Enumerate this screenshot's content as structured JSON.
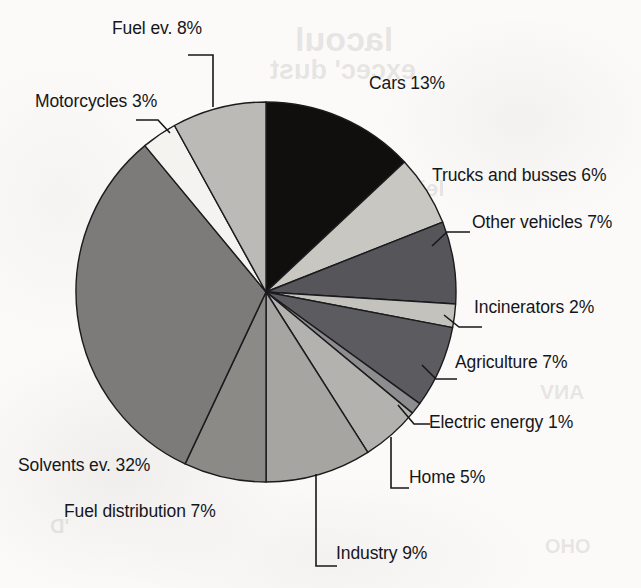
{
  "chart_data": {
    "type": "pie",
    "title": "",
    "subtitle": "",
    "xlabel": "",
    "ylabel": "",
    "legend_position": "callout-labels",
    "grid": false,
    "units": "percent",
    "start_angle_deg": 0,
    "direction": "clockwise",
    "categories": [
      "Cars",
      "Trucks and busses",
      "Other vehicles",
      "Incinerators",
      "Agriculture",
      "Electric energy",
      "Home",
      "Industry",
      "Fuel distribution",
      "Solvents ev.",
      "Motorcycles",
      "Fuel ev."
    ],
    "values": [
      13,
      6,
      7,
      2,
      7,
      1,
      5,
      9,
      7,
      32,
      3,
      8
    ],
    "slice_colors": [
      "#100f0e",
      "#c9c7c2",
      "#56555a",
      "#c4c2bd",
      "#5c5b60",
      "#8d8c8f",
      "#b4b2ae",
      "#a7a5a1",
      "#8c8a87",
      "#7d7b79",
      "#f4f3f0",
      "#bcbab6"
    ],
    "slices": [
      {
        "label": "Cars 13%",
        "name": "Cars",
        "value": 13,
        "color": "#100f0e"
      },
      {
        "label": "Trucks and busses 6%",
        "name": "Trucks and busses",
        "value": 6,
        "color": "#c9c7c2"
      },
      {
        "label": "Other vehicles 7%",
        "name": "Other vehicles",
        "value": 7,
        "color": "#56555a"
      },
      {
        "label": "Incinerators 2%",
        "name": "Incinerators",
        "value": 2,
        "color": "#c4c2bd"
      },
      {
        "label": "Agriculture 7%",
        "name": "Agriculture",
        "value": 7,
        "color": "#5c5b60"
      },
      {
        "label": "Electric energy 1%",
        "name": "Electric energy",
        "value": 1,
        "color": "#8d8c8f"
      },
      {
        "label": "Home 5%",
        "name": "Home",
        "value": 5,
        "color": "#b4b2ae"
      },
      {
        "label": "Industry 9%",
        "name": "Industry",
        "value": 9,
        "color": "#a7a5a1"
      },
      {
        "label": "Fuel distribution 7%",
        "name": "Fuel distribution",
        "value": 7,
        "color": "#8c8a87"
      },
      {
        "label": "Solvents ev. 32%",
        "name": "Solvents ev.",
        "value": 32,
        "color": "#7d7b79"
      },
      {
        "label": "Motorcycles 3%",
        "name": "Motorcycles",
        "value": 3,
        "color": "#f4f3f0"
      },
      {
        "label": "Fuel ev. 8%",
        "name": "Fuel ev.",
        "value": 8,
        "color": "#bcbab6"
      }
    ]
  },
  "labels": {
    "cars": "Cars 13%",
    "trucks_and_busses": "Trucks and busses 6%",
    "other_vehicles": "Other vehicles 7%",
    "incinerators": "Incinerators 2%",
    "agriculture": "Agriculture 7%",
    "electric_energy": "Electric energy 1%",
    "home": "Home 5%",
    "industry": "Industry 9%",
    "fuel_distribution": "Fuel distribution 7%",
    "solvents_ev": "Solvents ev. 32%",
    "motorcycles": "Motorcycles 3%",
    "fuel_ev": "Fuel ev. 8%"
  },
  "bleedthrough": {
    "line1": "lacoul",
    "line2": "excec' dust",
    "line3": "lei",
    "line4": "ANV",
    "line5": "OHO",
    "line6": "'D"
  }
}
